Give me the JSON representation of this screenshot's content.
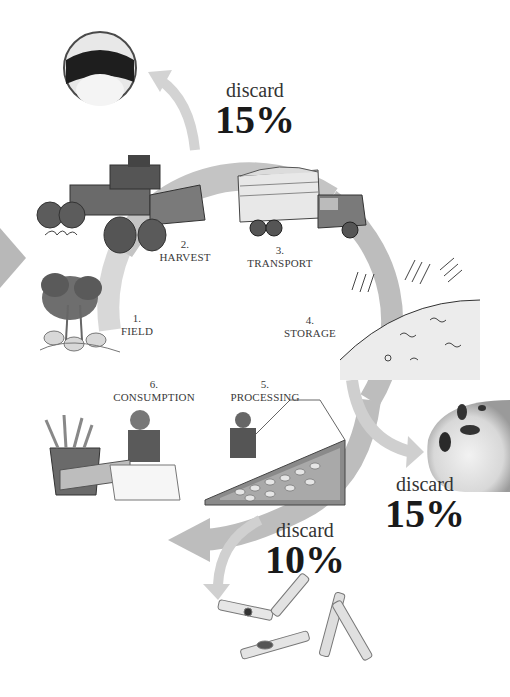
{
  "colors": {
    "background": "#ffffff",
    "cycle_ring": "#bdbdbd",
    "discard_arrow": "#cfcfcf",
    "text": "#333333",
    "percent_text": "#1a1a1a",
    "illustration_dark": "#5a5a5a"
  },
  "stages": [
    {
      "number": "1.",
      "name": "FIELD",
      "icon": "potato-plant-icon"
    },
    {
      "number": "2.",
      "name": "HARVEST",
      "icon": "harvester-icon"
    },
    {
      "number": "3.",
      "name": "TRANSPORT",
      "icon": "truck-icon"
    },
    {
      "number": "4.",
      "name": "STORAGE",
      "icon": "storage-pile-icon"
    },
    {
      "number": "5.",
      "name": "PROCESSING",
      "icon": "processing-line-icon"
    },
    {
      "number": "6.",
      "name": "CONSUMPTION",
      "icon": "fries-consumer-icon"
    }
  ],
  "discards": [
    {
      "position": "after-harvest",
      "label": "discard",
      "percent": "15%",
      "image": "bruised-potato-slice"
    },
    {
      "position": "after-storage",
      "label": "discard",
      "percent": "15%",
      "image": "spotted-potato"
    },
    {
      "position": "after-processing",
      "label": "discard",
      "percent": "10%",
      "image": "defective-fries"
    }
  ]
}
